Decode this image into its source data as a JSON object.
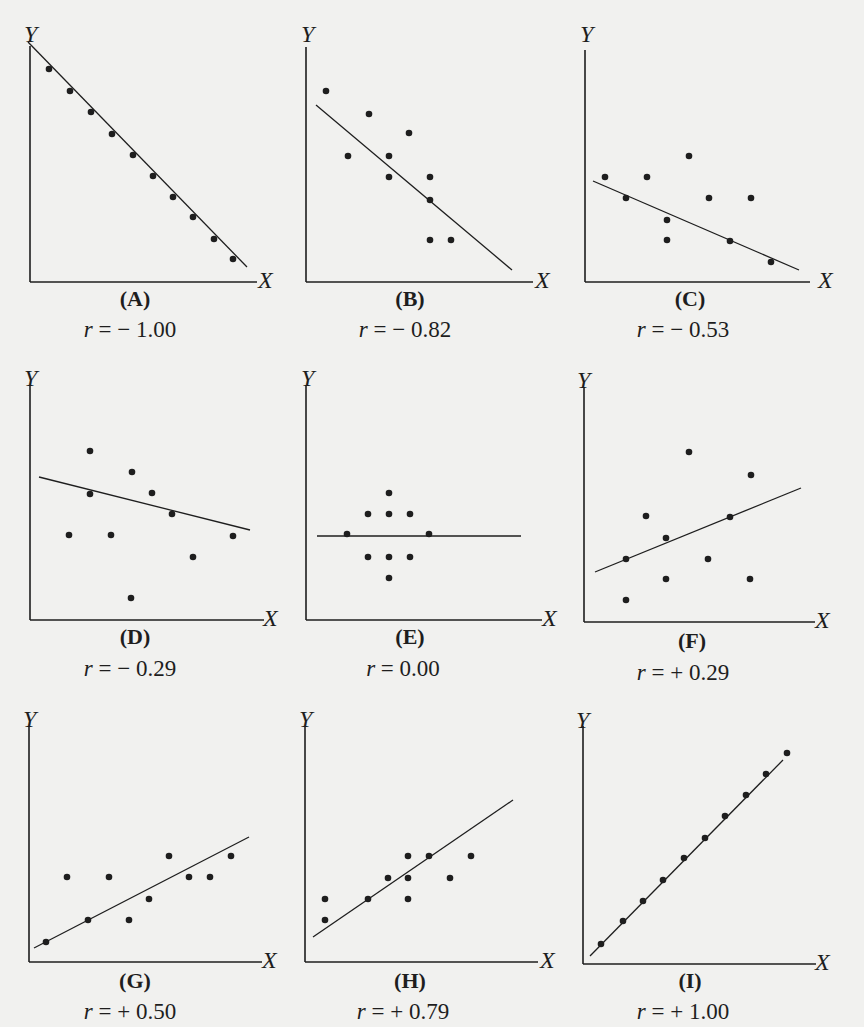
{
  "figure": {
    "background": "#f1f1ef",
    "ink": "#1e1e1e",
    "axis_labels": {
      "y": "Y",
      "x": "X"
    }
  },
  "chart_data": [
    {
      "id": "A",
      "type": "scatter",
      "panel_label": "(A)",
      "r_label": "r = − 1.00",
      "r": -1.0,
      "xlabel": "X",
      "ylabel": "Y",
      "fit_line": {
        "x1": -2,
        "y1": 240,
        "x2": 217,
        "y2": 15
      },
      "points": [
        [
          19,
          213
        ],
        [
          40,
          191
        ],
        [
          61,
          170
        ],
        [
          82,
          148
        ],
        [
          103,
          127
        ],
        [
          123,
          106
        ],
        [
          143,
          85
        ],
        [
          163,
          65
        ],
        [
          184,
          43
        ],
        [
          203,
          23
        ]
      ]
    },
    {
      "id": "B",
      "type": "scatter",
      "panel_label": "(B)",
      "r_label": "r = − 0.82",
      "r": -0.82,
      "xlabel": "X",
      "ylabel": "Y",
      "fit_line": {
        "x1": 10,
        "y1": 177,
        "x2": 206,
        "y2": 12
      },
      "points": [
        [
          20,
          191
        ],
        [
          63,
          168
        ],
        [
          103,
          149
        ],
        [
          42,
          126
        ],
        [
          83,
          126
        ],
        [
          83,
          105
        ],
        [
          124,
          105
        ],
        [
          124,
          82
        ],
        [
          124,
          42
        ],
        [
          145,
          42
        ]
      ]
    },
    {
      "id": "C",
      "type": "scatter",
      "panel_label": "(C)",
      "r_label": "r = − 0.53",
      "r": -0.53,
      "xlabel": "X",
      "ylabel": "Y",
      "fit_line": {
        "x1": 8,
        "y1": 101,
        "x2": 214,
        "y2": 12
      },
      "points": [
        [
          20,
          105
        ],
        [
          62,
          105
        ],
        [
          104,
          126
        ],
        [
          41,
          84
        ],
        [
          124,
          84
        ],
        [
          166,
          84
        ],
        [
          82,
          62
        ],
        [
          82,
          42
        ],
        [
          145,
          41
        ],
        [
          186,
          20
        ]
      ]
    },
    {
      "id": "D",
      "type": "scatter",
      "panel_label": "(D)",
      "r_label": "r = − 0.29",
      "r": -0.29,
      "xlabel": "X",
      "ylabel": "Y",
      "fit_line": {
        "x1": 9,
        "y1": 143,
        "x2": 220,
        "y2": 90
      },
      "points": [
        [
          60,
          169
        ],
        [
          102,
          148
        ],
        [
          60,
          126
        ],
        [
          122,
          127
        ],
        [
          142,
          106
        ],
        [
          39,
          85
        ],
        [
          81,
          85
        ],
        [
          203,
          84
        ],
        [
          163,
          63
        ],
        [
          101,
          22
        ]
      ]
    },
    {
      "id": "E",
      "type": "scatter",
      "panel_label": "(E)",
      "r_label": "r = 0.00",
      "r": 0.0,
      "xlabel": "X",
      "ylabel": "Y",
      "fit_line": {
        "x1": 11,
        "y1": 84,
        "x2": 215,
        "y2": 84
      },
      "points": [
        [
          83,
          127
        ],
        [
          62,
          106
        ],
        [
          83,
          106
        ],
        [
          104,
          106
        ],
        [
          41,
          86
        ],
        [
          123,
          86
        ],
        [
          62,
          63
        ],
        [
          83,
          63
        ],
        [
          104,
          63
        ],
        [
          83,
          42
        ]
      ]
    },
    {
      "id": "F",
      "type": "scatter",
      "panel_label": "(F)",
      "r_label": "r = + 0.29",
      "r": 0.29,
      "xlabel": "X",
      "ylabel": "Y",
      "fit_line": {
        "x1": 11,
        "y1": 50,
        "x2": 217,
        "y2": 134
      },
      "points": [
        [
          105,
          170
        ],
        [
          167,
          147
        ],
        [
          62,
          106
        ],
        [
          146,
          105
        ],
        [
          82,
          84
        ],
        [
          42,
          63
        ],
        [
          124,
          63
        ],
        [
          82,
          43
        ],
        [
          166,
          43
        ],
        [
          42,
          22
        ]
      ]
    },
    {
      "id": "G",
      "type": "scatter",
      "panel_label": "(G)",
      "r_label": "r = + 0.50",
      "r": 0.5,
      "xlabel": "X",
      "ylabel": "Y",
      "fit_line": {
        "x1": 5,
        "y1": 14,
        "x2": 220,
        "y2": 125
      },
      "points": [
        [
          17,
          20
        ],
        [
          59,
          42
        ],
        [
          100,
          42
        ],
        [
          120,
          63
        ],
        [
          140,
          106
        ],
        [
          160,
          85
        ],
        [
          38,
          85
        ],
        [
          80,
          85
        ],
        [
          181,
          85
        ],
        [
          202,
          106
        ]
      ]
    },
    {
      "id": "H",
      "type": "scatter",
      "panel_label": "(H)",
      "r_label": "r = + 0.79",
      "r": 0.79,
      "xlabel": "X",
      "ylabel": "Y",
      "fit_line": {
        "x1": 8,
        "y1": 25,
        "x2": 208,
        "y2": 162
      },
      "points": [
        [
          20,
          42
        ],
        [
          20,
          63
        ],
        [
          63,
          63
        ],
        [
          83,
          84
        ],
        [
          103,
          63
        ],
        [
          103,
          84
        ],
        [
          103,
          106
        ],
        [
          124,
          106
        ],
        [
          145,
          84
        ],
        [
          166,
          106
        ]
      ]
    },
    {
      "id": "I",
      "type": "scatter",
      "panel_label": "(I)",
      "r_label": "r = + 1.00",
      "r": 1.0,
      "xlabel": "X",
      "ylabel": "Y",
      "fit_line": {
        "x1": 7,
        "y1": 8,
        "x2": 200,
        "y2": 204
      },
      "points": [
        [
          18,
          20
        ],
        [
          40,
          43
        ],
        [
          60,
          63
        ],
        [
          80,
          84
        ],
        [
          101,
          106
        ],
        [
          122,
          126
        ],
        [
          142,
          148
        ],
        [
          163,
          169
        ],
        [
          183,
          190
        ],
        [
          204,
          211
        ]
      ]
    }
  ],
  "panels_layout": [
    {
      "id": "A",
      "origin": [
        30,
        282
      ],
      "axis_w": 227,
      "axis_h": 236,
      "xlab": [
        258,
        268
      ],
      "ylab": [
        24,
        22
      ]
    },
    {
      "id": "B",
      "origin": [
        306,
        282
      ],
      "axis_w": 227,
      "axis_h": 235,
      "xlab": [
        535,
        268
      ],
      "ylab": [
        301,
        22
      ]
    },
    {
      "id": "C",
      "origin": [
        585,
        282
      ],
      "axis_w": 225,
      "axis_h": 232,
      "xlab": [
        818,
        268
      ],
      "ylab": [
        580,
        22
      ]
    },
    {
      "id": "D",
      "origin": [
        30,
        620
      ],
      "axis_w": 234,
      "axis_h": 235,
      "xlab": [
        263,
        606
      ],
      "ylab": [
        24,
        366
      ]
    },
    {
      "id": "E",
      "origin": [
        306,
        620
      ],
      "axis_w": 236,
      "axis_h": 235,
      "xlab": [
        542,
        606
      ],
      "ylab": [
        301,
        366
      ]
    },
    {
      "id": "F",
      "origin": [
        584,
        622
      ],
      "axis_w": 231,
      "axis_h": 235,
      "xlab": [
        815,
        608
      ],
      "ylab": [
        577,
        368
      ]
    },
    {
      "id": "G",
      "origin": [
        29,
        962
      ],
      "axis_w": 233,
      "axis_h": 236,
      "xlab": [
        262,
        948
      ],
      "ylab": [
        23,
        707
      ]
    },
    {
      "id": "H",
      "origin": [
        305,
        962
      ],
      "axis_w": 233,
      "axis_h": 236,
      "xlab": [
        540,
        948
      ],
      "ylab": [
        299,
        707
      ]
    },
    {
      "id": "I",
      "origin": [
        583,
        964
      ],
      "axis_w": 233,
      "axis_h": 238,
      "xlab": [
        815,
        950
      ],
      "ylab": [
        576,
        708
      ]
    }
  ],
  "labels_layout": [
    {
      "id": "A",
      "plabel": [
        95,
        288
      ],
      "rlabel": [
        40,
        318
      ]
    },
    {
      "id": "B",
      "plabel": [
        370,
        288
      ],
      "rlabel": [
        315,
        318
      ]
    },
    {
      "id": "C",
      "plabel": [
        650,
        288
      ],
      "rlabel": [
        593,
        318
      ]
    },
    {
      "id": "D",
      "plabel": [
        95,
        626
      ],
      "rlabel": [
        40,
        657
      ]
    },
    {
      "id": "E",
      "plabel": [
        370,
        626
      ],
      "rlabel": [
        313,
        657
      ]
    },
    {
      "id": "F",
      "plabel": [
        652,
        630
      ],
      "rlabel": [
        593,
        661
      ]
    },
    {
      "id": "G",
      "plabel": [
        95,
        970
      ],
      "rlabel": [
        40,
        1000
      ]
    },
    {
      "id": "H",
      "plabel": [
        370,
        970
      ],
      "rlabel": [
        313,
        1000
      ]
    },
    {
      "id": "I",
      "plabel": [
        650,
        970
      ],
      "rlabel": [
        593,
        1000
      ]
    }
  ]
}
